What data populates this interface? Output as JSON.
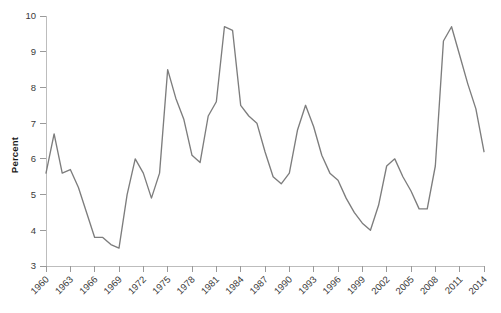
{
  "chart_data": {
    "type": "line",
    "title": "",
    "subtitle": "",
    "xlabel": "",
    "ylabel": "Percent",
    "xlim": [
      1960,
      2014
    ],
    "ylim": [
      3,
      10
    ],
    "grid": false,
    "legend": null,
    "line_color": "#7d7d7d",
    "axis_color": "#bdbdbd",
    "tick_color": "#9a9a9a",
    "text_color": "#3a3a3a",
    "yticks": [
      3,
      4,
      5,
      6,
      7,
      8,
      9,
      10
    ],
    "ytick_labels": [
      "3",
      "4",
      "5",
      "6",
      "7",
      "8",
      "9",
      "10"
    ],
    "xticks": [
      1960,
      1963,
      1966,
      1969,
      1972,
      1975,
      1978,
      1981,
      1984,
      1987,
      1990,
      1993,
      1996,
      1999,
      2002,
      2005,
      2008,
      2011,
      2014
    ],
    "xtick_labels": [
      "1960",
      "1963",
      "1966",
      "1969",
      "1972",
      "1975",
      "1978",
      "1981",
      "1984",
      "1987",
      "1990",
      "1993",
      "1996",
      "1999",
      "2002",
      "2005",
      "2008",
      "2011",
      "2014"
    ],
    "xtick_rotation": -45,
    "series": [
      {
        "name": "Unemployment rate",
        "x": [
          1960,
          1961,
          1962,
          1963,
          1964,
          1965,
          1966,
          1967,
          1968,
          1969,
          1970,
          1971,
          1972,
          1973,
          1974,
          1975,
          1976,
          1977,
          1978,
          1979,
          1980,
          1981,
          1982,
          1983,
          1984,
          1985,
          1986,
          1987,
          1988,
          1989,
          1990,
          1991,
          1992,
          1993,
          1994,
          1995,
          1996,
          1997,
          1998,
          1999,
          2000,
          2001,
          2002,
          2003,
          2004,
          2005,
          2006,
          2007,
          2008,
          2009,
          2010,
          2011,
          2012,
          2013,
          2014
        ],
        "values": [
          5.6,
          6.7,
          5.6,
          5.7,
          5.2,
          4.5,
          3.8,
          3.8,
          3.6,
          3.5,
          5.0,
          6.0,
          5.6,
          4.9,
          5.6,
          8.5,
          7.7,
          7.1,
          6.1,
          5.9,
          7.2,
          7.6,
          9.7,
          9.6,
          7.5,
          7.2,
          7.0,
          6.2,
          5.5,
          5.3,
          5.6,
          6.8,
          7.5,
          6.9,
          6.1,
          5.6,
          5.4,
          4.9,
          4.5,
          4.2,
          4.0,
          4.7,
          5.8,
          6.0,
          5.5,
          5.1,
          4.6,
          4.6,
          5.8,
          9.3,
          9.7,
          8.9,
          8.1,
          7.4,
          6.2
        ]
      }
    ]
  },
  "layout": {
    "plot_left": 46,
    "plot_right": 484,
    "plot_top": 16,
    "plot_bottom": 266
  }
}
